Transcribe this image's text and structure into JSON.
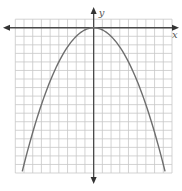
{
  "chart_data": {
    "type": "line",
    "title": "",
    "xlabel": "x",
    "ylabel": "y",
    "xlim": [
      -9,
      9
    ],
    "ylim": [
      -17,
      1
    ],
    "grid": true,
    "grid_step": 1,
    "tick_labels": false,
    "axes_arrows": true,
    "function": "y = -x^2 / 4",
    "vertex": [
      0,
      0
    ],
    "series": [
      {
        "name": "parabola",
        "color": "#6e6e6e",
        "x": [
          -8.2,
          -8,
          -6,
          -4,
          -2,
          0,
          2,
          4,
          6,
          8,
          8.2
        ],
        "y": [
          -16.81,
          -16,
          -9,
          -4,
          -1,
          0,
          -1,
          -4,
          -9,
          -16,
          -16.81
        ]
      }
    ]
  },
  "colors": {
    "grid": "#c8c8c8",
    "axis": "#4a4a4a",
    "curve": "#6e6e6e"
  }
}
